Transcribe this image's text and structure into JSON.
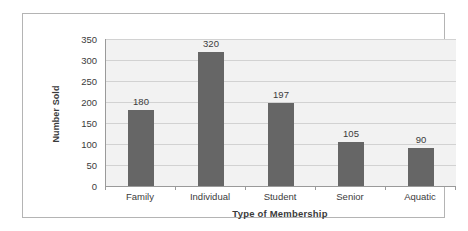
{
  "chart_data": {
    "type": "bar",
    "title": "",
    "categories": [
      "Family",
      "Individual",
      "Student",
      "Senior",
      "Aquatic"
    ],
    "values": [
      180,
      320,
      197,
      105,
      90
    ],
    "data_labels": [
      "180",
      "320",
      "197",
      "105",
      "90"
    ],
    "xlabel": "Type of Membership",
    "ylabel": "Number Sold",
    "ylim": [
      0,
      350
    ],
    "ytick_labels": [
      "0",
      "50",
      "100",
      "150",
      "200",
      "250",
      "300",
      "350"
    ],
    "ytick_values": [
      0,
      50,
      100,
      150,
      200,
      250,
      300,
      350
    ],
    "grid": true,
    "legend": "none",
    "colors": {
      "bar": "#666666",
      "plot_background": "#f2f2f2",
      "gridline": "#d2d2d2",
      "axis": "#9a9a9a",
      "text": "#3b3b3b",
      "frame_border": "#b4b4b4",
      "page_background": "#ffffff"
    }
  }
}
